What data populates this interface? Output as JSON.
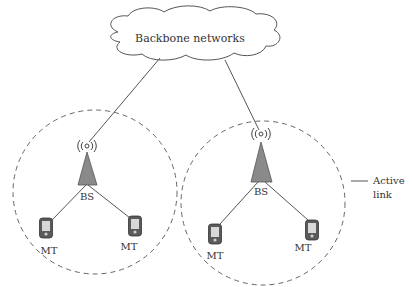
{
  "diagram": {
    "type": "network-architecture",
    "cloud": {
      "label": "Backbone networks",
      "icon": "cloud-shape"
    },
    "cells": [
      {
        "id": "cell-left",
        "base_station": {
          "label": "BS",
          "icon": "antenna-tower-icon"
        },
        "mobile_terminals": [
          {
            "label": "MT",
            "icon": "mobile-phone-icon"
          },
          {
            "label": "MT",
            "icon": "mobile-phone-icon"
          }
        ]
      },
      {
        "id": "cell-right",
        "base_station": {
          "label": "BS",
          "icon": "antenna-tower-icon"
        },
        "mobile_terminals": [
          {
            "label": "MT",
            "icon": "mobile-phone-icon"
          },
          {
            "label": "MT",
            "icon": "mobile-phone-icon"
          }
        ]
      }
    ],
    "legend": {
      "items": [
        {
          "symbol": "solid-line",
          "label_line1": "Active",
          "label_line2": "link"
        }
      ]
    },
    "colors": {
      "line": "#555555",
      "dash": "#666666",
      "tower_fill": "#8a8a8a",
      "phone_body": "#5a5a5a",
      "phone_screen": "#d8d8d8",
      "text": "#333333"
    }
  }
}
